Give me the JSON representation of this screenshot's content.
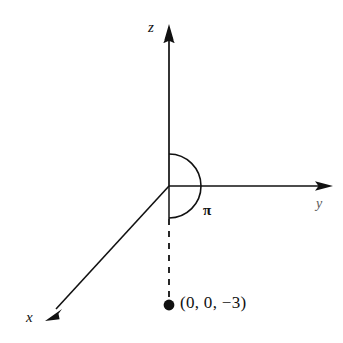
{
  "figure": {
    "type": "3d-coordinate-axes-diagram",
    "background_color": "#ffffff",
    "stroke_color": "#111111",
    "origin": {
      "x": 169,
      "y": 186
    },
    "axes": [
      {
        "name": "z-axis",
        "label": "z",
        "direction": "up",
        "tip": {
          "x": 169,
          "y": 26
        },
        "style": "solid",
        "arrowhead": true
      },
      {
        "name": "y-axis",
        "label": "y",
        "direction": "right",
        "tip": {
          "x": 331,
          "y": 186
        },
        "style": "solid",
        "arrowhead": true
      },
      {
        "name": "x-axis",
        "label": "x",
        "direction": "down-left",
        "tip": {
          "x": 46,
          "y": 319
        },
        "style": "solid",
        "arrowhead": true
      }
    ],
    "angle_arc": {
      "label": "π",
      "radius": 32,
      "from_degrees": 90,
      "to_degrees": 270,
      "sweep": "clockwise-through-positive-y",
      "label_position": {
        "x": 210,
        "y": 211
      }
    },
    "dashed_segment": {
      "name": "drop-line",
      "from": {
        "x": 169,
        "y": 186
      },
      "to": {
        "x": 169,
        "y": 303
      },
      "style": "dashed"
    },
    "point": {
      "label": "(0, 0, −3)",
      "marker": "filled-circle",
      "radius": 5,
      "position": {
        "x": 169,
        "y": 305
      },
      "coordinates": [
        0,
        0,
        -3
      ]
    }
  }
}
